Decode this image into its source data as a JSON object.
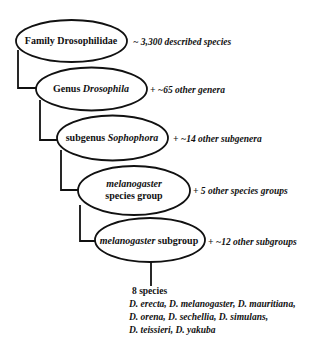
{
  "diagram": {
    "colors": {
      "stroke": "#111111",
      "background": "#ffffff"
    },
    "nodes": [
      {
        "id": "family",
        "prefix": "Family Drosophilidae",
        "italic": "",
        "suffix": "",
        "annotation": "~ 3,300 described species"
      },
      {
        "id": "genus",
        "prefix": "Genus ",
        "italic": "Drosophila",
        "suffix": "",
        "annotation": "+ ~65 other genera"
      },
      {
        "id": "subgenus",
        "prefix": "subgenus ",
        "italic": "Sophophora",
        "suffix": "",
        "annotation": "+ ~14 other subgenera"
      },
      {
        "id": "species-group",
        "prefix": "",
        "italic": "melanogaster",
        "suffix": "species group",
        "annotation": "+ 5 other species groups"
      },
      {
        "id": "subgroup",
        "prefix": "",
        "italic": "melanogaster",
        "suffix": " subgroup",
        "annotation": "+ ~12 other subgroups"
      }
    ],
    "leaf": {
      "count_label": "8 species",
      "species_lines": [
        "D. erecta, D. melanogaster, D. mauritiana,",
        "D. orena, D. sechellia, D. simulans,",
        "D. teissieri, D. yakuba"
      ]
    }
  }
}
